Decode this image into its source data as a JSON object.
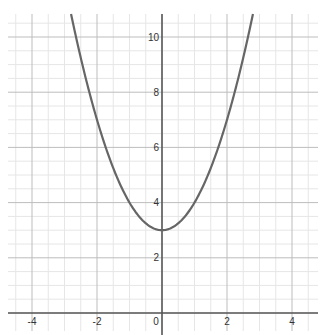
{
  "chart_data": {
    "type": "line",
    "title": "",
    "xlabel": "",
    "ylabel": "",
    "function": "y = x^2 + 3",
    "xlim": [
      -4.9,
      4.9
    ],
    "ylim": [
      0,
      11
    ],
    "grid": true,
    "major_step": 2,
    "minor_step": 0.5,
    "x_ticks": [
      "-4",
      "-2",
      "0",
      "2",
      "4"
    ],
    "y_ticks": [
      "2",
      "4",
      "6",
      "8",
      "10"
    ],
    "series": [
      {
        "name": "parabola",
        "color": "#666666",
        "x": [
          -2.8,
          -2.5,
          -2,
          -1.5,
          -1,
          -0.5,
          0,
          0.5,
          1,
          1.5,
          2,
          2.5,
          2.8
        ],
        "y": [
          10.84,
          9.25,
          7,
          5.25,
          4,
          3.25,
          3,
          3.25,
          4,
          5.25,
          7,
          9.25,
          10.84
        ]
      }
    ],
    "vertex": {
      "x": 0,
      "y": 3
    }
  },
  "colors": {
    "major_grid": "#bdbdbd",
    "minor_grid": "#e6e6e6",
    "axis": "#555555",
    "curve": "#666666"
  }
}
